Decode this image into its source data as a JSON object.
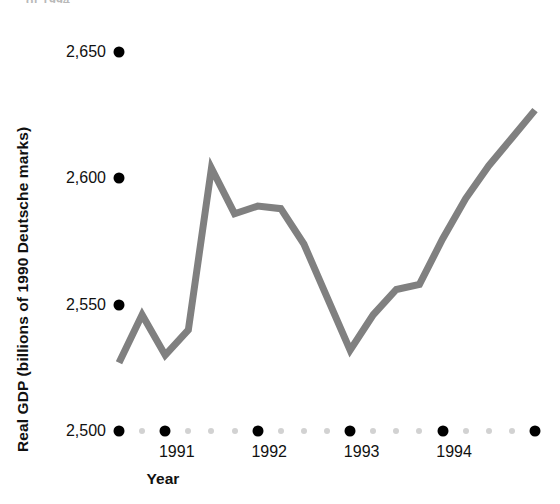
{
  "caption_remnant": "of 1994.",
  "chart_data": {
    "type": "line",
    "title": "",
    "xlabel": "Year",
    "ylabel": "Real GDP (billions of 1990 Deutsche marks)",
    "ylim": [
      2500,
      2650
    ],
    "yticks": [
      2500,
      2550,
      2600,
      2650
    ],
    "ytick_labels": [
      "2,500",
      "2,550",
      "2,600",
      "2,650"
    ],
    "xlim": [
      1990.375,
      1994.875
    ],
    "xticks": [
      1991,
      1992,
      1993,
      1994
    ],
    "xtick_labels": [
      "1991",
      "1992",
      "1993",
      "1994"
    ],
    "grid": false,
    "legend": "none",
    "line_color": "#808080",
    "line_width": 7,
    "x": [
      1990.375,
      1990.625,
      1990.875,
      1991.125,
      1991.375,
      1991.625,
      1991.875,
      1992.125,
      1992.375,
      1992.625,
      1992.875,
      1993.125,
      1993.375,
      1993.625,
      1993.875,
      1994.125,
      1994.375,
      1994.625,
      1994.875
    ],
    "values": [
      2527,
      2546,
      2530,
      2540,
      2604,
      2586,
      2589,
      2588,
      2574,
      2553,
      2532,
      2546,
      2556,
      2558,
      2576,
      2592,
      2605,
      2616,
      2627
    ],
    "series": [
      {
        "name": "Real GDP",
        "values": [
          2527,
          2546,
          2530,
          2540,
          2604,
          2586,
          2589,
          2588,
          2574,
          2553,
          2532,
          2546,
          2556,
          2558,
          2576,
          2592,
          2605,
          2616,
          2627
        ]
      }
    ]
  },
  "axis_markers": {
    "major_dot_color": "#000000",
    "minor_dot_color": "#d2d2d2",
    "x_major_positions": [
      1990.375,
      1990.875,
      1991.875,
      1992.875,
      1993.875,
      1994.875
    ],
    "x_minor_positions": [
      1990.625,
      1991.125,
      1991.375,
      1991.625,
      1992.125,
      1992.375,
      1992.625,
      1993.125,
      1993.375,
      1993.625,
      1994.125,
      1994.375,
      1994.625
    ]
  }
}
